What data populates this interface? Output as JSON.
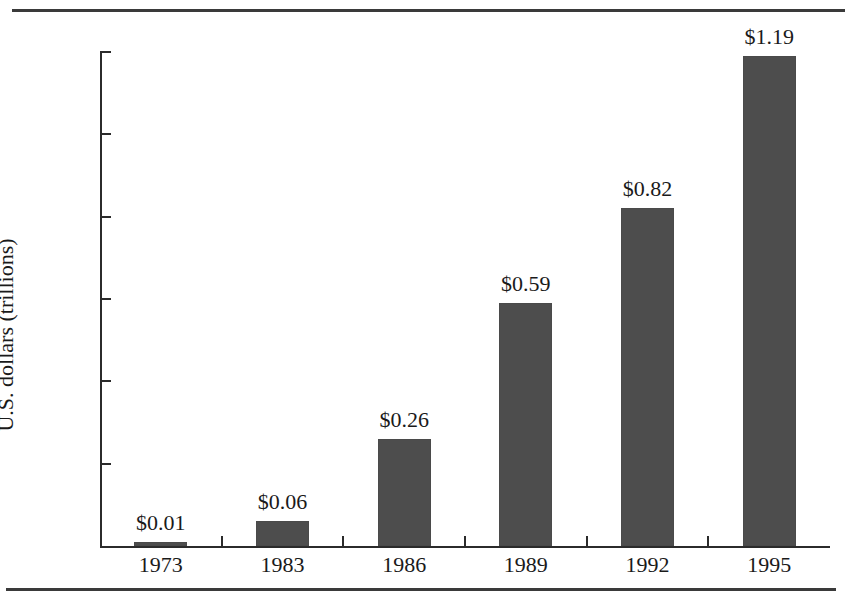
{
  "chart_data": {
    "type": "bar",
    "title": "",
    "xlabel": "",
    "ylabel": "U.S. dollars (trillions)",
    "categories": [
      "1973",
      "1983",
      "1986",
      "1989",
      "1992",
      "1995"
    ],
    "values": [
      0.01,
      0.06,
      0.26,
      0.59,
      0.82,
      1.19
    ],
    "value_labels": [
      "$0.01",
      "$0.06",
      "$0.26",
      "$0.59",
      "$0.82",
      "$1.19"
    ],
    "ylim": [
      0,
      1.2
    ],
    "ytick_labels": [
      "1.20",
      "1.00",
      "0.80",
      "0.60",
      "0.40",
      "0.20"
    ],
    "ytick_values": [
      1.2,
      1.0,
      0.8,
      0.6,
      0.4,
      0.2
    ],
    "grid": false,
    "legend": false,
    "bar_color": "#4d4d4d",
    "axis_color": "#2b2b2b",
    "background_color": "#ffffff"
  },
  "figure": {
    "rule_color": "#3a3a3a"
  }
}
